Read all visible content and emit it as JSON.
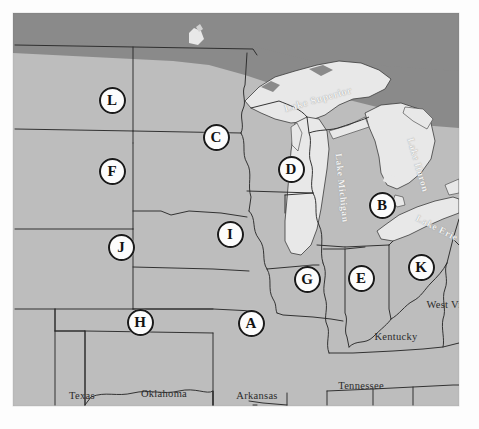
{
  "figure": {
    "region": "Midwest and Upper South, United States",
    "colors": {
      "land": "#bdbdbd",
      "foreign_land": "#8a8a8a",
      "water": "#e8e8e8",
      "border": "#2a2a2a",
      "marker_fill": "#fcfcfc",
      "marker_ring": "#1a1a1a",
      "marker_text": "#121212",
      "label_text": "#2b2b2b",
      "lake_label_text": "#f2f2f2",
      "page_background": "#ffffff"
    }
  },
  "markers": [
    {
      "id": "marker-l",
      "letter": "L",
      "x": 99,
      "y": 87
    },
    {
      "id": "marker-c",
      "letter": "C",
      "x": 203,
      "y": 124
    },
    {
      "id": "marker-f",
      "letter": "F",
      "x": 99,
      "y": 158
    },
    {
      "id": "marker-d",
      "letter": "D",
      "x": 278,
      "y": 156
    },
    {
      "id": "marker-b",
      "letter": "B",
      "x": 369,
      "y": 192
    },
    {
      "id": "marker-i",
      "letter": "I",
      "x": 217,
      "y": 221
    },
    {
      "id": "marker-j",
      "letter": "J",
      "x": 108,
      "y": 234
    },
    {
      "id": "marker-k",
      "letter": "K",
      "x": 408,
      "y": 254
    },
    {
      "id": "marker-e",
      "letter": "E",
      "x": 348,
      "y": 265
    },
    {
      "id": "marker-g",
      "letter": "G",
      "x": 294,
      "y": 266
    },
    {
      "id": "marker-h",
      "letter": "H",
      "x": 127,
      "y": 309
    },
    {
      "id": "marker-a",
      "letter": "A",
      "x": 238,
      "y": 310
    }
  ],
  "state_labels": [
    {
      "id": "label-texas",
      "text": "Texas",
      "x": 69,
      "y": 382,
      "multiline": false
    },
    {
      "id": "label-oklahoma",
      "text": "Oklahoma",
      "x": 151,
      "y": 380,
      "multiline": false
    },
    {
      "id": "label-arkansas",
      "text": "Arkansas",
      "x": 244,
      "y": 382,
      "multiline": false
    },
    {
      "id": "label-tennessee",
      "text": "Tennessee",
      "x": 348,
      "y": 372,
      "multiline": false
    },
    {
      "id": "label-kentucky",
      "text": "Kentucky",
      "x": 383,
      "y": 323,
      "multiline": false
    },
    {
      "id": "label-west-virginia",
      "text": "West Virginia",
      "x": 444,
      "y": 292,
      "multiline": true
    }
  ],
  "lake_labels": [
    {
      "id": "label-lake-superior",
      "text": "Lake Superior",
      "x": 305,
      "y": 86,
      "rotate": -16,
      "size": 10
    },
    {
      "id": "label-lake-michigan",
      "text": "Lake Michigan",
      "x": 329,
      "y": 175,
      "rotate": 84,
      "size": 9.5
    },
    {
      "id": "label-lake-huron",
      "text": "Lake Huron",
      "x": 405,
      "y": 152,
      "rotate": 74,
      "size": 9.5
    },
    {
      "id": "label-lake-erie",
      "text": "Lake Erie",
      "x": 424,
      "y": 215,
      "rotate": 27,
      "size": 9.5
    }
  ],
  "legend": {
    "marker_letters": [
      "A",
      "B",
      "C",
      "D",
      "E",
      "F",
      "G",
      "H",
      "I",
      "J",
      "K",
      "L"
    ],
    "marker_count": 12
  }
}
